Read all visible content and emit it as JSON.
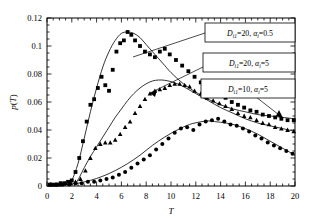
{
  "chart_data": {
    "type": "scatter",
    "title": "",
    "xlabel": "T",
    "ylabel": "p(T)",
    "xlim": [
      0,
      20
    ],
    "ylim": [
      0,
      0.12
    ],
    "xticks": [
      0,
      2,
      4,
      6,
      8,
      10,
      12,
      14,
      16,
      18,
      20
    ],
    "xtick_labels": [
      "0",
      "2",
      "4",
      "6",
      "8",
      "10",
      "12",
      "14",
      "16",
      "18",
      "20"
    ],
    "yticks": [
      0,
      0.02,
      0.04,
      0.06,
      0.08,
      0.1,
      0.12
    ],
    "ytick_labels": [
      "0",
      "0.02",
      "0.04",
      "0.06",
      "0.08",
      "0.1",
      "0.12"
    ],
    "grid": false,
    "minor_ticks": true,
    "legend_position": "upper-right-boxes",
    "series": [
      {
        "name": "D_i1=20, alpha_i=0.5",
        "label_main": "D",
        "label_sub1": "i1",
        "label_mid": "=20, ",
        "label_alpha": "α",
        "label_sub2": "i",
        "label_end": "=0.5",
        "marker": "square",
        "points_x": [
          0.2,
          0.5,
          0.8,
          1.1,
          1.4,
          1.7,
          2.0,
          2.3,
          2.6,
          2.9,
          3.2,
          3.5,
          3.8,
          4.1,
          4.4,
          4.7,
          5.0,
          5.3,
          5.6,
          5.9,
          6.2,
          6.5,
          6.8,
          7.1,
          7.5,
          7.9,
          8.3,
          8.7,
          9.1,
          9.5,
          9.9,
          10.4,
          10.9,
          11.4,
          11.9,
          12.4,
          12.9,
          13.4,
          13.9,
          14.4,
          14.9,
          15.4,
          15.9,
          16.4,
          16.9,
          17.4,
          17.9,
          18.4,
          18.9,
          19.4,
          19.9
        ],
        "points_y": [
          0.001,
          0.001,
          0.001,
          0.002,
          0.002,
          0.003,
          0.004,
          0.01,
          0.02,
          0.032,
          0.046,
          0.058,
          0.062,
          0.07,
          0.078,
          0.072,
          0.068,
          0.083,
          0.096,
          0.102,
          0.104,
          0.11,
          0.108,
          0.104,
          0.1,
          0.096,
          0.094,
          0.092,
          0.096,
          0.098,
          0.094,
          0.09,
          0.086,
          0.082,
          0.078,
          0.074,
          0.072,
          0.068,
          0.066,
          0.063,
          0.06,
          0.058,
          0.056,
          0.054,
          0.053,
          0.051,
          0.05,
          0.049,
          0.048,
          0.047,
          0.047
        ],
        "curve_x": [
          1.6,
          2.0,
          2.5,
          3.0,
          3.5,
          4.0,
          4.5,
          5.0,
          5.5,
          6.0,
          6.5,
          7.0,
          7.5,
          8.0,
          8.5,
          9.0,
          9.5,
          10.0,
          11.0,
          12.0,
          13.0,
          14.0,
          15.0,
          16.0,
          17.0,
          18.0,
          19.0,
          20.0
        ],
        "curve_y": [
          0.0,
          0.004,
          0.016,
          0.034,
          0.053,
          0.07,
          0.085,
          0.096,
          0.104,
          0.109,
          0.11,
          0.109,
          0.106,
          0.101,
          0.096,
          0.091,
          0.086,
          0.081,
          0.073,
          0.067,
          0.062,
          0.058,
          0.055,
          0.053,
          0.051,
          0.05,
          0.049,
          0.048
        ]
      },
      {
        "name": "D_i1=20, alpha_i=5",
        "label_main": "D",
        "label_sub1": "i1",
        "label_mid": "=20, ",
        "label_alpha": "α",
        "label_sub2": "i",
        "label_end": "=5",
        "marker": "triangle",
        "points_x": [
          0.3,
          0.7,
          1.1,
          1.5,
          1.9,
          2.3,
          2.7,
          3.1,
          3.5,
          3.9,
          4.3,
          4.7,
          5.1,
          5.5,
          5.9,
          6.3,
          6.7,
          7.1,
          7.5,
          7.9,
          8.3,
          8.7,
          9.1,
          9.5,
          9.9,
          10.3,
          10.7,
          11.1,
          11.5,
          11.9,
          12.4,
          12.9,
          13.4,
          13.9,
          14.4,
          14.9,
          15.4,
          15.9,
          16.4,
          16.9,
          17.4,
          17.9,
          18.4,
          18.9,
          19.4,
          19.9
        ],
        "points_y": [
          0.001,
          0.001,
          0.001,
          0.002,
          0.002,
          0.003,
          0.005,
          0.011,
          0.02,
          0.027,
          0.03,
          0.031,
          0.031,
          0.033,
          0.037,
          0.042,
          0.046,
          0.052,
          0.057,
          0.062,
          0.066,
          0.068,
          0.069,
          0.07,
          0.072,
          0.073,
          0.073,
          0.072,
          0.071,
          0.068,
          0.066,
          0.063,
          0.061,
          0.059,
          0.057,
          0.055,
          0.052,
          0.05,
          0.049,
          0.047,
          0.045,
          0.044,
          0.042,
          0.041,
          0.04,
          0.039
        ],
        "curve_x": [
          2.2,
          2.6,
          3.0,
          3.5,
          4.0,
          4.5,
          5.0,
          5.5,
          6.0,
          6.5,
          7.0,
          7.5,
          8.0,
          8.5,
          9.0,
          9.5,
          10.0,
          10.5,
          11.0,
          12.0,
          13.0,
          14.0,
          15.0,
          16.0,
          17.0,
          18.0,
          19.0,
          20.0
        ],
        "curve_y": [
          0.0,
          0.006,
          0.013,
          0.021,
          0.028,
          0.035,
          0.042,
          0.049,
          0.055,
          0.061,
          0.066,
          0.07,
          0.073,
          0.075,
          0.0757,
          0.0755,
          0.0745,
          0.073,
          0.071,
          0.066,
          0.061,
          0.056,
          0.052,
          0.048,
          0.045,
          0.043,
          0.041,
          0.039
        ]
      },
      {
        "name": "D_i1=10, alpha_i=5",
        "label_main": "D",
        "label_sub1": "i1",
        "label_mid": "=10, ",
        "label_alpha": "α",
        "label_sub2": "i",
        "label_end": "=5",
        "marker": "circle",
        "points_x": [
          0.3,
          0.8,
          1.3,
          1.8,
          2.3,
          2.8,
          3.3,
          3.8,
          4.3,
          4.8,
          5.3,
          5.8,
          6.3,
          6.8,
          7.3,
          7.8,
          8.3,
          8.8,
          9.3,
          9.8,
          10.3,
          10.8,
          11.3,
          11.8,
          12.3,
          12.8,
          13.3,
          13.8,
          14.3,
          14.8,
          15.3,
          15.8,
          16.3,
          16.8,
          17.3,
          17.8,
          18.3,
          18.8,
          19.3,
          19.8
        ],
        "points_y": [
          0.001,
          0.001,
          0.001,
          0.001,
          0.002,
          0.002,
          0.003,
          0.003,
          0.004,
          0.005,
          0.006,
          0.008,
          0.01,
          0.013,
          0.016,
          0.019,
          0.022,
          0.026,
          0.03,
          0.034,
          0.038,
          0.041,
          0.042,
          0.04,
          0.044,
          0.046,
          0.047,
          0.048,
          0.046,
          0.044,
          0.043,
          0.041,
          0.039,
          0.036,
          0.034,
          0.031,
          0.029,
          0.027,
          0.025,
          0.023
        ],
        "curve_x": [
          0.5,
          1.5,
          2.5,
          3.5,
          4.5,
          5.5,
          6.5,
          7.5,
          8.5,
          9.5,
          10.5,
          11.5,
          12.5,
          13.0,
          13.5,
          14.0,
          15.0,
          16.0,
          17.0,
          18.0,
          19.0,
          20.0
        ],
        "curve_y": [
          0.0,
          0.001,
          0.002,
          0.004,
          0.007,
          0.011,
          0.016,
          0.022,
          0.029,
          0.035,
          0.04,
          0.044,
          0.046,
          0.0465,
          0.046,
          0.0455,
          0.044,
          0.041,
          0.037,
          0.032,
          0.027,
          0.022
        ]
      }
    ]
  },
  "axes": {
    "xlabel": "T",
    "ylabel_main": "p",
    "ylabel_paren_open": "(",
    "ylabel_var": "T",
    "ylabel_paren_close": ")"
  }
}
